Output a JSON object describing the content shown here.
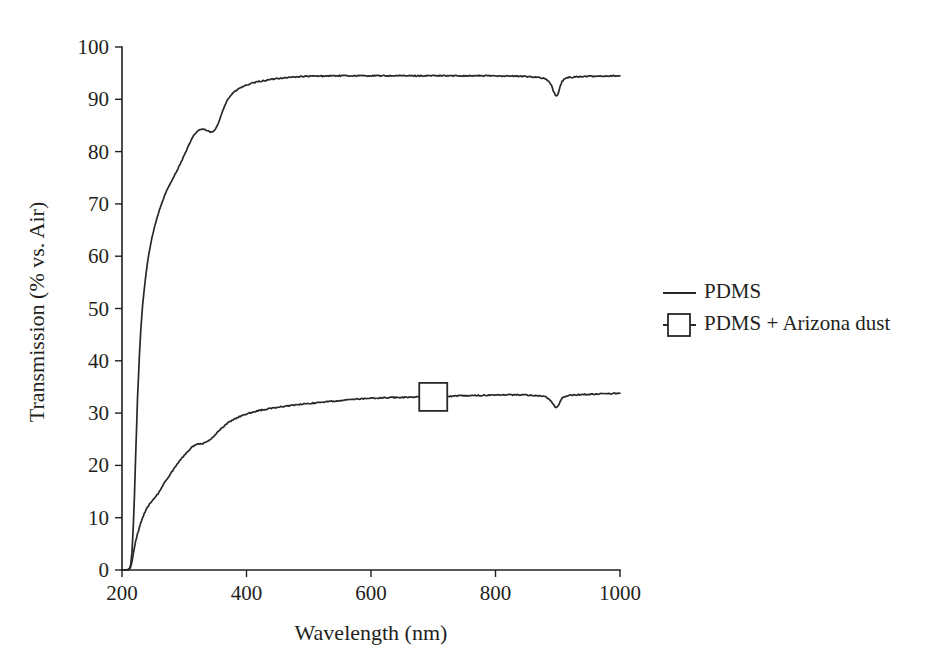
{
  "chart_data": {
    "type": "line",
    "title": "",
    "subtitle": "",
    "xlabel": "Wavelength (nm)",
    "ylabel": "Transmission (% vs. Air)",
    "xlim": [
      200,
      1000
    ],
    "ylim": [
      0,
      100
    ],
    "xticks": [
      200,
      400,
      600,
      800,
      1000
    ],
    "xtick_labels": [
      "200",
      "400",
      "600",
      "800",
      "1000"
    ],
    "yticks": [
      0,
      10,
      20,
      30,
      40,
      50,
      60,
      70,
      80,
      90,
      100
    ],
    "ytick_labels": [
      "0",
      "10",
      "20",
      "30",
      "40",
      "50",
      "60",
      "70",
      "80",
      "90",
      "100"
    ],
    "grid": false,
    "legend_position": "right",
    "legend": [
      {
        "name": "PDMS",
        "marker": "none",
        "line": "solid"
      },
      {
        "name": "PDMS + Arizona dust",
        "marker": "open-square",
        "line": "solid"
      }
    ],
    "series": [
      {
        "name": "PDMS",
        "marker": "none",
        "color": "#2b2724",
        "x": [
          200,
          205,
          210,
          212,
          214,
          216,
          218,
          220,
          222,
          225,
          228,
          230,
          233,
          236,
          240,
          244,
          248,
          252,
          256,
          260,
          265,
          270,
          275,
          280,
          285,
          290,
          295,
          300,
          305,
          310,
          315,
          320,
          325,
          330,
          335,
          340,
          345,
          350,
          355,
          360,
          365,
          370,
          375,
          380,
          390,
          400,
          410,
          420,
          430,
          440,
          450,
          460,
          470,
          480,
          490,
          500,
          520,
          540,
          560,
          580,
          600,
          620,
          640,
          660,
          680,
          700,
          720,
          740,
          760,
          780,
          800,
          820,
          840,
          860,
          870,
          880,
          885,
          890,
          893,
          896,
          898,
          900,
          902,
          904,
          907,
          910,
          915,
          920,
          930,
          940,
          950,
          960,
          970,
          980,
          990,
          1000
        ],
        "y": [
          0.0,
          0.0,
          0.1,
          0.3,
          1.0,
          3.5,
          8.0,
          14.0,
          22.0,
          33.0,
          41.0,
          45.5,
          50.5,
          54.0,
          58.0,
          61.0,
          63.5,
          65.5,
          67.2,
          68.8,
          70.5,
          72.0,
          73.3,
          74.5,
          75.6,
          76.8,
          78.0,
          79.3,
          80.6,
          81.9,
          83.0,
          83.8,
          84.2,
          84.3,
          84.1,
          83.8,
          83.7,
          84.2,
          85.5,
          87.3,
          88.8,
          90.0,
          90.8,
          91.4,
          92.2,
          92.7,
          93.1,
          93.4,
          93.6,
          93.8,
          94.0,
          94.1,
          94.2,
          94.3,
          94.35,
          94.4,
          94.45,
          94.5,
          94.5,
          94.5,
          94.5,
          94.5,
          94.5,
          94.5,
          94.5,
          94.5,
          94.5,
          94.5,
          94.5,
          94.5,
          94.5,
          94.45,
          94.4,
          94.3,
          94.2,
          93.9,
          93.5,
          92.6,
          91.6,
          90.8,
          90.6,
          90.8,
          91.6,
          92.6,
          93.4,
          93.8,
          94.1,
          94.2,
          94.3,
          94.35,
          94.4,
          94.4,
          94.45,
          94.45,
          94.5,
          94.5
        ]
      },
      {
        "name": "PDMS + Arizona dust",
        "marker": "open-square",
        "marker_x": [
          700
        ],
        "marker_y": [
          33.1
        ],
        "color": "#2b2724",
        "x": [
          200,
          205,
          210,
          212,
          214,
          216,
          218,
          220,
          222,
          225,
          228,
          230,
          233,
          236,
          240,
          244,
          248,
          252,
          256,
          260,
          265,
          270,
          275,
          280,
          285,
          290,
          295,
          300,
          305,
          310,
          315,
          320,
          325,
          330,
          335,
          340,
          345,
          350,
          355,
          360,
          365,
          370,
          375,
          380,
          390,
          400,
          410,
          420,
          430,
          440,
          450,
          460,
          470,
          480,
          490,
          500,
          520,
          540,
          560,
          580,
          600,
          620,
          640,
          660,
          680,
          700,
          720,
          740,
          760,
          780,
          800,
          820,
          840,
          860,
          870,
          880,
          885,
          890,
          893,
          896,
          898,
          900,
          902,
          904,
          907,
          910,
          915,
          920,
          930,
          940,
          950,
          960,
          970,
          980,
          990,
          1000
        ],
        "y": [
          0.0,
          0.0,
          0.05,
          0.2,
          0.6,
          1.6,
          3.0,
          4.4,
          5.6,
          6.9,
          8.1,
          8.9,
          9.9,
          10.8,
          11.8,
          12.6,
          13.2,
          13.7,
          14.3,
          15.0,
          16.0,
          17.0,
          17.9,
          18.8,
          19.6,
          20.4,
          21.2,
          21.9,
          22.6,
          23.2,
          23.7,
          24.0,
          24.1,
          24.2,
          24.4,
          24.8,
          25.3,
          25.9,
          26.5,
          27.1,
          27.6,
          28.1,
          28.5,
          28.8,
          29.4,
          29.8,
          30.2,
          30.5,
          30.7,
          30.9,
          31.1,
          31.3,
          31.4,
          31.6,
          31.7,
          31.8,
          32.1,
          32.3,
          32.5,
          32.7,
          32.8,
          32.9,
          33.0,
          33.05,
          33.1,
          33.1,
          33.2,
          33.3,
          33.35,
          33.4,
          33.45,
          33.5,
          33.5,
          33.4,
          33.3,
          33.1,
          32.8,
          32.2,
          31.6,
          31.2,
          31.1,
          31.2,
          31.6,
          32.2,
          32.8,
          33.1,
          33.3,
          33.4,
          33.5,
          33.55,
          33.6,
          33.65,
          33.7,
          33.7,
          33.75,
          33.8
        ]
      }
    ]
  },
  "colors": {
    "ink": "#231f20",
    "line": "#2b2724",
    "background": "#ffffff"
  }
}
